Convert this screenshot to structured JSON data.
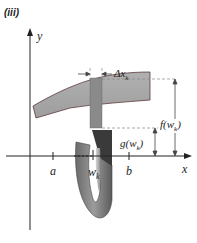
{
  "figure": {
    "panel_label": "(iii)",
    "axes": {
      "x_label": "x",
      "y_label": "y"
    },
    "ticks": {
      "a": "a",
      "b": "b",
      "w": "w",
      "w_sub": "k"
    },
    "annotations": {
      "delta_x": "Δx",
      "delta_x_sub": "k",
      "f": "f(w",
      "f_sub": "k",
      "f_close": ")",
      "g": "g(w",
      "g_sub": "k",
      "g_close": ")"
    },
    "colors": {
      "slab_fill": "#a9a9a9",
      "slab_stroke": "#4a2e2e",
      "strip_fill": "#8c8c8c",
      "washer_dark": "#555555",
      "washer_light": "#9a9a9a",
      "axis": "#222222",
      "dashed": "#888888"
    }
  }
}
